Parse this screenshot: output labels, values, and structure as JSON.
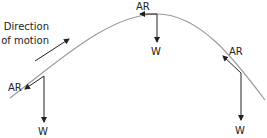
{
  "diagram": {
    "direction_label_line1": "Direction",
    "direction_label_line2": "of motion",
    "points": [
      {
        "position": "ascending",
        "air_resistance_label": "AR",
        "weight_label": "W"
      },
      {
        "position": "peak",
        "air_resistance_label": "AR",
        "weight_label": "W"
      },
      {
        "position": "descending",
        "air_resistance_label": "AR",
        "weight_label": "W"
      }
    ],
    "colors": {
      "trajectory": "#9a9a9a",
      "arrows": "#222222",
      "text": "#222222"
    }
  }
}
